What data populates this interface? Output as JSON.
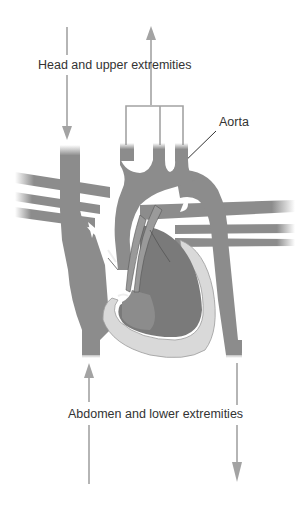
{
  "diagram": {
    "labels": {
      "head": "Head and upper extremities",
      "aorta": "Aorta",
      "abdomen": "Abdomen and lower extremities"
    },
    "arrows": [
      {
        "name": "head-inflow-arrow",
        "direction": "down",
        "label_ref": "head"
      },
      {
        "name": "head-outflow-arrow",
        "direction": "up",
        "label_ref": "head"
      },
      {
        "name": "abdomen-inflow-arrow",
        "direction": "up",
        "label_ref": "abdomen"
      },
      {
        "name": "abdomen-outflow-arrow",
        "direction": "down",
        "label_ref": "abdomen"
      },
      {
        "name": "aorta-pointer-arrow",
        "direction": "down-left",
        "label_ref": "aorta"
      }
    ],
    "colors": {
      "vessel": "#8c8c8c",
      "vessel_dark": "#7a7a7a",
      "chamber_wall": "#d9d9d9",
      "arrow": "#a3a3a3",
      "text": "#333333",
      "background": "#ffffff"
    }
  }
}
